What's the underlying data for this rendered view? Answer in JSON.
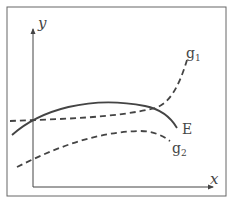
{
  "diagram": {
    "type": "function-curves",
    "axes": {
      "x_label": "x",
      "y_label": "y"
    },
    "curves": [
      {
        "id": "E",
        "label": "E",
        "style": "solid",
        "description": "concave curve rising then falling after its maximum"
      },
      {
        "id": "g1",
        "label": "g",
        "label_sub": "1",
        "style": "dashed",
        "description": "convex curve intersecting E at y-axis and at E's maximum, then rising steeply"
      },
      {
        "id": "g2",
        "label": "g",
        "label_sub": "2",
        "style": "dashed",
        "description": "lower concave curve below E, rising then falling"
      }
    ],
    "colors": {
      "stroke": "#444444",
      "frame": "#555555",
      "background": "#ffffff"
    }
  }
}
